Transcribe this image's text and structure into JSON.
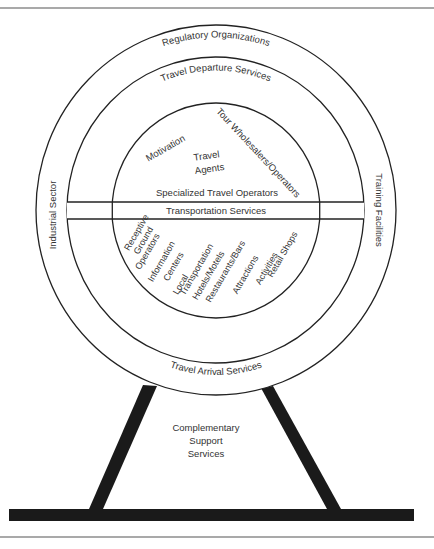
{
  "diagram": {
    "colors": {
      "line": "#222222",
      "text": "#333333",
      "background": "#ffffff",
      "rule": "#555555"
    },
    "outer_ring": {
      "top_label": "Regulatory Organizations",
      "left_label": "Industrial Sector",
      "right_label": "Training Facilities"
    },
    "middle_ring": {
      "top_label": "Travel Departure Services",
      "bottom_label": "Travel Arrival Services"
    },
    "inner_upper": {
      "motivation": "Motivation",
      "tour": "Tour Wholesalers/Operators",
      "travel_agents_line1": "Travel",
      "travel_agents_line2": "Agents",
      "specialized": "Specialized Travel Operators"
    },
    "band": {
      "label": "Transportation Services"
    },
    "inner_lower": {
      "items": [
        "Receptive",
        "Ground",
        "Operators",
        "Information",
        "Centers",
        "Local",
        "Transportation",
        "Hotels/Motels",
        "Restaurants/Bars",
        "Attractions",
        "Activities",
        "Retail Shops"
      ]
    },
    "stand": {
      "line1": "Complementary",
      "line2": "Support",
      "line3": "Services"
    }
  }
}
